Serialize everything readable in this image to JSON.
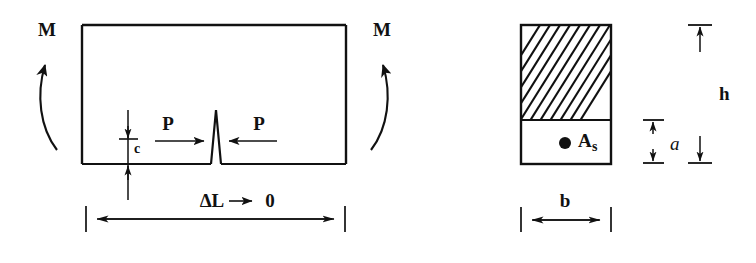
{
  "figure": {
    "background_color": "#ffffff",
    "ink_color": "#111111"
  },
  "beam_diagram": {
    "name": "beam-elevation",
    "moment_left": {
      "label": "M",
      "icon": "curved-arrow-counterclockwise-icon"
    },
    "moment_right": {
      "label": "M",
      "icon": "curved-arrow-clockwise-icon"
    },
    "force_left": {
      "label": "P",
      "icon": "arrow-right-icon"
    },
    "force_right": {
      "label": "P",
      "icon": "arrow-left-icon"
    },
    "crack_depth": {
      "label": "c",
      "icon": "dimension-arrow-vertical-icon"
    },
    "span_dimension": {
      "label_delta": "ΔL",
      "label_limit": "0",
      "arrow_icon": "arrow-right-icon",
      "dimension_icon": "dimension-arrow-horizontal-icon"
    }
  },
  "cross_section": {
    "name": "beam-cross-section",
    "hatched_region_label": "compression-zone-hatch",
    "steel_area": {
      "label_base": "A",
      "label_sub": "s",
      "marker_icon": "rebar-dot-icon"
    },
    "depth_a": {
      "label": "a",
      "icon": "dimension-arrow-vertical-icon"
    },
    "depth_h": {
      "label": "h",
      "icon": "dimension-arrow-vertical-icon"
    },
    "width_b": {
      "label": "b",
      "icon": "dimension-arrow-horizontal-icon"
    }
  }
}
